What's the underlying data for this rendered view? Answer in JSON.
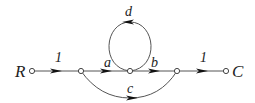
{
  "diagram": {
    "type": "signal-flow-graph",
    "nodes": [
      {
        "id": "R",
        "label": "R",
        "x": 32,
        "y": 71
      },
      {
        "id": "n1",
        "label": "",
        "x": 81,
        "y": 71
      },
      {
        "id": "n2",
        "label": "",
        "x": 130,
        "y": 71
      },
      {
        "id": "n3",
        "label": "",
        "x": 177,
        "y": 71
      },
      {
        "id": "C",
        "label": "C",
        "x": 226,
        "y": 71
      }
    ],
    "edges": [
      {
        "from": "R",
        "to": "n1",
        "gain": "1"
      },
      {
        "from": "n1",
        "to": "n2",
        "gain": "a"
      },
      {
        "from": "n2",
        "to": "n3",
        "gain": "b"
      },
      {
        "from": "n3",
        "to": "C",
        "gain": "1"
      },
      {
        "from": "n2",
        "to": "n2",
        "gain": "d",
        "kind": "self-loop"
      },
      {
        "from": "n1",
        "to": "n3",
        "gain": "c",
        "kind": "arc-below"
      }
    ],
    "labels": {
      "input": "R",
      "output": "C",
      "g_r1": "1",
      "g_a": "a",
      "g_b": "b",
      "g_1c": "1",
      "g_d": "d",
      "g_c": "c"
    }
  }
}
